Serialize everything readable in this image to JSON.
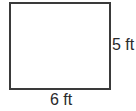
{
  "diagram": {
    "shape": "rectangle",
    "width_label": "6 ft",
    "height_label": "5 ft",
    "stroke_color": "#3a3a3a"
  }
}
